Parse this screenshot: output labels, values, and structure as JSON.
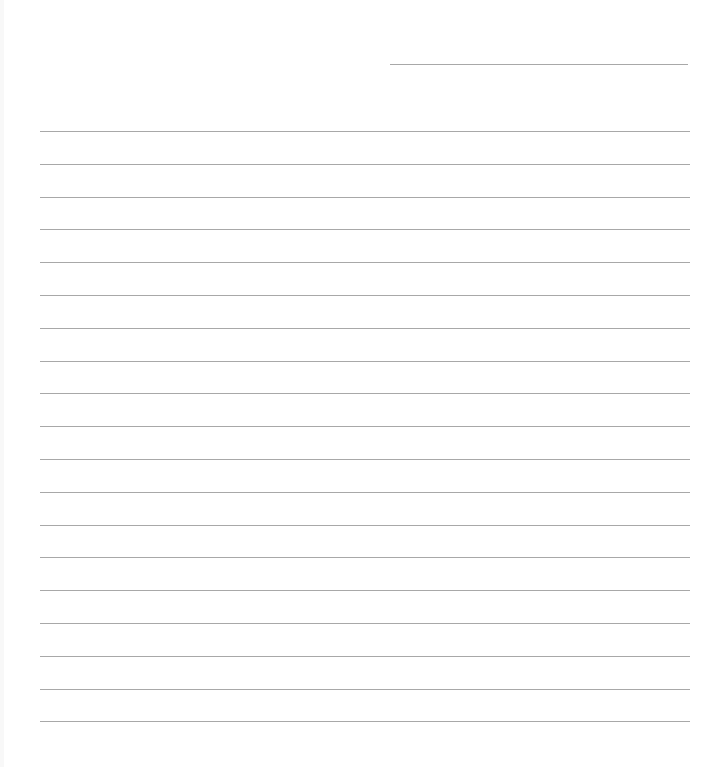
{
  "document": {
    "type": "lined-paper",
    "header_line": {
      "x1": 390,
      "x2": 688,
      "y": 64
    },
    "ruled_lines": {
      "count": 19,
      "x1": 40,
      "x2": 690,
      "first_y": 131,
      "spacing": 32.8
    },
    "line_color": "#a8a8a8"
  }
}
